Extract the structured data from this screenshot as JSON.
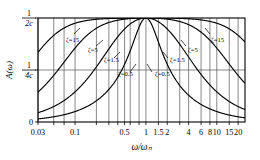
{
  "chart_data": {
    "type": "line",
    "title": "",
    "xlabel": "ω/ωₙ",
    "ylabel": "A(ω)",
    "xscale": "log",
    "grid": true,
    "legend_position": "inline-annotations",
    "xlim": [
      0.03,
      25
    ],
    "ylim": [
      0,
      1
    ],
    "y_ticks": [
      {
        "value": 0.0,
        "label": "0"
      },
      {
        "value": 0.5,
        "label_num": "1",
        "label_den": "4c"
      },
      {
        "value": 1.0,
        "label_num": "1",
        "label_den": "2c"
      }
    ],
    "x_ticks": [
      {
        "value": 0.03,
        "label": "0.03"
      },
      {
        "value": 0.05,
        "label": ""
      },
      {
        "value": 0.07,
        "label": ""
      },
      {
        "value": 0.1,
        "label": "0.1"
      },
      {
        "value": 0.2,
        "label": ""
      },
      {
        "value": 0.3,
        "label": ""
      },
      {
        "value": 0.4,
        "label": ""
      },
      {
        "value": 0.5,
        "label": "0.5"
      },
      {
        "value": 0.6,
        "label": ""
      },
      {
        "value": 0.8,
        "label": ""
      },
      {
        "value": 1,
        "label": "1"
      },
      {
        "value": 1.5,
        "label": "1.5"
      },
      {
        "value": 2,
        "label": "2"
      },
      {
        "value": 3,
        "label": ""
      },
      {
        "value": 4,
        "label": "4"
      },
      {
        "value": 6,
        "label": "6"
      },
      {
        "value": 8,
        "label": "8"
      },
      {
        "value": 10,
        "label": "10"
      },
      {
        "value": 15,
        "label": "15"
      },
      {
        "value": 20,
        "label": "20"
      }
    ],
    "series": [
      {
        "name": "ζ=15",
        "zeta": 15,
        "peak_x": 1.0,
        "peak_y": 1.0
      },
      {
        "name": "ζ=5",
        "zeta": 5,
        "peak_x": 1.0,
        "peak_y": 1.0
      },
      {
        "name": "ζ=1.5",
        "zeta": 1.5,
        "peak_x": 1.0,
        "peak_y": 1.0
      },
      {
        "name": "ζ=0.5",
        "zeta": 0.5,
        "peak_x": 1.0,
        "peak_y": 1.0
      }
    ],
    "annotations": [
      {
        "text": "ζ=15",
        "x_px": 66,
        "y_px": 42,
        "tick_x1": 74,
        "tick_y1": 34,
        "tick_x2": 80,
        "tick_y2": 28
      },
      {
        "text": "ζ=5",
        "x_px": 88,
        "y_px": 52,
        "tick_x1": 96,
        "tick_y1": 46,
        "tick_x2": 103,
        "tick_y2": 40
      },
      {
        "text": "ζ=1.5",
        "x_px": 104,
        "y_px": 62,
        "tick_x1": 114,
        "tick_y1": 58,
        "tick_x2": 120,
        "tick_y2": 52
      },
      {
        "text": "ζ=0.5",
        "x_px": 118,
        "y_px": 76,
        "tick_x1": 130,
        "tick_y1": 72,
        "tick_x2": 136,
        "tick_y2": 64
      },
      {
        "text": "ζ=0.5",
        "x_px": 155,
        "y_px": 76,
        "tick_x1": 152,
        "tick_y1": 72,
        "tick_x2": 147,
        "tick_y2": 64
      },
      {
        "text": "ζ=1.5",
        "x_px": 170,
        "y_px": 62,
        "tick_x1": 168,
        "tick_y1": 58,
        "tick_x2": 163,
        "tick_y2": 52
      },
      {
        "text": "ζ=5",
        "x_px": 188,
        "y_px": 52,
        "tick_x1": 186,
        "tick_y1": 46,
        "tick_x2": 181,
        "tick_y2": 40
      },
      {
        "text": "ζ=15",
        "x_px": 211,
        "y_px": 42,
        "tick_x1": 210,
        "tick_y1": 34,
        "tick_x2": 205,
        "tick_y2": 28
      }
    ],
    "colors": {
      "curve": "#000000",
      "axis": "#000000",
      "grid": "#555555",
      "background": "#ffffff"
    }
  }
}
